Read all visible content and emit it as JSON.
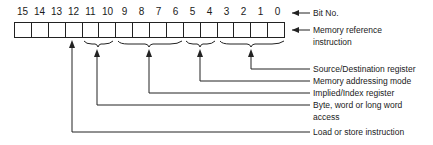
{
  "diagram": {
    "bit_numbers": [
      "15",
      "14",
      "13",
      "12",
      "11",
      "10",
      "9",
      "8",
      "7",
      "6",
      "5",
      "4",
      "3",
      "2",
      "1",
      "0"
    ],
    "bit_label": "Bit No.",
    "register_label_line1": "Memory reference",
    "register_label_line2": "instruction",
    "fields": [
      {
        "bits": "3-0",
        "label": "Source/Destination register"
      },
      {
        "bits": "5-4",
        "label": "Memory addressing mode"
      },
      {
        "bits": "9-6",
        "label": "Implied/Index register"
      },
      {
        "bits": "11-10",
        "label_line1": "Byte, word or long word",
        "label_line2": "access"
      },
      {
        "bits": "12",
        "label": "Load or store instruction"
      }
    ]
  }
}
